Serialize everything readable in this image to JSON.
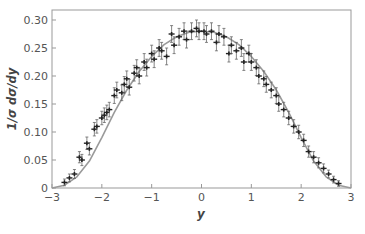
{
  "chart_data": {
    "type": "scatter",
    "title": "",
    "xlabel": "y",
    "ylabel": "1/σ dσ/dy",
    "xlim": [
      -3,
      3
    ],
    "ylim": [
      0,
      0.32
    ],
    "grid": false,
    "legend": null,
    "x_ticks": [
      "−3",
      "−2",
      "−1",
      "0",
      "1",
      "2",
      "3"
    ],
    "y_ticks": [
      "0",
      "0.05",
      "0.10",
      "0.15",
      "0.20",
      "0.25",
      "0.30"
    ],
    "series": [
      {
        "name": "data",
        "style": "points with error bars",
        "x": [
          -2.75,
          -2.65,
          -2.55,
          -2.45,
          -2.4,
          -2.3,
          -2.25,
          -2.15,
          -2.1,
          -2.0,
          -1.95,
          -1.9,
          -1.85,
          -1.75,
          -1.7,
          -1.6,
          -1.55,
          -1.5,
          -1.45,
          -1.35,
          -1.3,
          -1.25,
          -1.15,
          -1.1,
          -1.0,
          -0.95,
          -0.85,
          -0.8,
          -0.7,
          -0.6,
          -0.55,
          -0.45,
          -0.35,
          -0.3,
          -0.2,
          -0.1,
          -0.05,
          0.05,
          0.1,
          0.2,
          0.3,
          0.35,
          0.45,
          0.55,
          0.6,
          0.7,
          0.8,
          0.85,
          0.95,
          1.0,
          1.1,
          1.15,
          1.25,
          1.3,
          1.4,
          1.5,
          1.55,
          1.65,
          1.75,
          1.85,
          1.95,
          2.05,
          2.15,
          2.25,
          2.35,
          2.45,
          2.55,
          2.65,
          2.75
        ],
        "values": [
          0.01,
          0.018,
          0.025,
          0.055,
          0.05,
          0.08,
          0.07,
          0.105,
          0.11,
          0.125,
          0.13,
          0.135,
          0.14,
          0.165,
          0.175,
          0.17,
          0.185,
          0.195,
          0.18,
          0.205,
          0.215,
          0.2,
          0.225,
          0.215,
          0.24,
          0.23,
          0.25,
          0.245,
          0.235,
          0.275,
          0.255,
          0.27,
          0.28,
          0.265,
          0.28,
          0.285,
          0.28,
          0.28,
          0.275,
          0.28,
          0.26,
          0.275,
          0.27,
          0.24,
          0.255,
          0.245,
          0.25,
          0.225,
          0.24,
          0.225,
          0.215,
          0.2,
          0.195,
          0.185,
          0.175,
          0.165,
          0.15,
          0.14,
          0.125,
          0.11,
          0.1,
          0.085,
          0.065,
          0.055,
          0.045,
          0.035,
          0.025,
          0.015,
          0.008
        ],
        "errors": [
          0.006,
          0.007,
          0.008,
          0.01,
          0.01,
          0.011,
          0.011,
          0.012,
          0.012,
          0.012,
          0.013,
          0.013,
          0.013,
          0.014,
          0.014,
          0.014,
          0.014,
          0.014,
          0.014,
          0.014,
          0.014,
          0.014,
          0.015,
          0.015,
          0.015,
          0.015,
          0.015,
          0.015,
          0.015,
          0.015,
          0.015,
          0.015,
          0.015,
          0.015,
          0.015,
          0.015,
          0.015,
          0.015,
          0.015,
          0.015,
          0.015,
          0.015,
          0.015,
          0.015,
          0.015,
          0.015,
          0.015,
          0.015,
          0.015,
          0.015,
          0.014,
          0.014,
          0.014,
          0.014,
          0.014,
          0.014,
          0.013,
          0.013,
          0.012,
          0.012,
          0.012,
          0.011,
          0.01,
          0.01,
          0.009,
          0.008,
          0.007,
          0.006,
          0.005
        ]
      },
      {
        "name": "theory",
        "style": "solid gray curve",
        "x": [
          -3.0,
          -2.75,
          -2.5,
          -2.25,
          -2.0,
          -1.75,
          -1.5,
          -1.25,
          -1.0,
          -0.75,
          -0.5,
          -0.25,
          0.0,
          0.25,
          0.5,
          0.75,
          1.0,
          1.25,
          1.5,
          1.75,
          2.0,
          2.25,
          2.5,
          2.75,
          3.0
        ],
        "values": [
          0.0,
          0.005,
          0.02,
          0.048,
          0.09,
          0.135,
          0.175,
          0.208,
          0.235,
          0.256,
          0.27,
          0.278,
          0.28,
          0.278,
          0.27,
          0.256,
          0.235,
          0.208,
          0.175,
          0.135,
          0.09,
          0.048,
          0.02,
          0.005,
          0.0
        ]
      }
    ]
  },
  "style": {
    "point_color": "#222222",
    "curve_color": "#9a9a9a",
    "axis_color": "#888888"
  }
}
